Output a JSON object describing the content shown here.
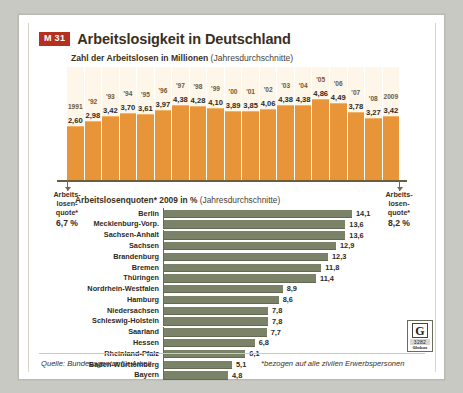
{
  "header": {
    "badge": "M 31",
    "title": "Arbeitslosigkeit in Deutschland",
    "subtitle_bold": "Zahl der Arbeitslosen in Millionen",
    "subtitle_light": "(Jahresdurchschnitte)"
  },
  "quote_left": {
    "line1": "Arbeits-",
    "line2": "losen-",
    "line3": "quote*",
    "value": "6,7 %"
  },
  "quote_right": {
    "line1": "Arbeits-",
    "line2": "losen-",
    "line3": "quote*",
    "value": "8,2 %"
  },
  "bar_header": {
    "bold": "Arbeitslosenquoten* 2009 in %",
    "light": "(Jahresdurchschnitte)"
  },
  "footer": {
    "source": "Quelle: Bundesagentur für Arbeit",
    "note": "*bezogen auf alle zivilen Erwerbspersonen",
    "logo_letter": "G",
    "logo_number": "3282",
    "logo_name": "Globus"
  },
  "colors": {
    "accent_red": "#b5301f",
    "column_orange": "#e8953a",
    "bar_green": "#7a8268",
    "column_bg": "#fdf6e9",
    "card_bg": "#ffffff"
  },
  "chart_data": [
    {
      "type": "bar",
      "title": "Zahl der Arbeitslosen in Millionen (Jahresdurchschnitte)",
      "xlabel": "",
      "ylabel": "Millionen",
      "ylim": [
        0,
        5.2
      ],
      "categories": [
        "1991",
        "'92",
        "'93",
        "'94",
        "'95",
        "'96",
        "'97",
        "'98",
        "'99",
        "'00",
        "'01",
        "'02",
        "'03",
        "'04",
        "'05",
        "'06",
        "'07",
        "'08",
        "2009"
      ],
      "values": [
        2.6,
        2.98,
        3.42,
        3.7,
        3.61,
        3.97,
        4.38,
        4.28,
        4.1,
        3.89,
        3.85,
        4.06,
        4.38,
        4.38,
        4.86,
        4.49,
        3.78,
        3.27,
        3.42
      ],
      "value_labels": [
        "2,60",
        "2,98",
        "3,42",
        "3,70",
        "3,61",
        "3,97",
        "4,38",
        "4,28",
        "4,10",
        "3,89",
        "3,85",
        "4,06",
        "4,38",
        "4,38",
        "4,86",
        "4,49",
        "3,78",
        "3,27",
        "3,42"
      ]
    },
    {
      "type": "bar",
      "title": "Arbeitslosenquoten* 2009 in % (Jahresdurchschnitte)",
      "xlabel": "%",
      "ylabel": "",
      "xlim": [
        0,
        14.1
      ],
      "categories": [
        "Berlin",
        "Mecklenburg-Vorp.",
        "Sachsen-Anhalt",
        "Sachsen",
        "Brandenburg",
        "Bremen",
        "Thüringen",
        "Nordrhein-Westfalen",
        "Hamburg",
        "Niedersachsen",
        "Schleswig-Holstein",
        "Saarland",
        "Hessen",
        "Rheinland-Pfalz",
        "Baden-Württemberg",
        "Bayern"
      ],
      "values": [
        14.1,
        13.6,
        13.6,
        12.9,
        12.3,
        11.8,
        11.4,
        8.9,
        8.6,
        7.8,
        7.8,
        7.7,
        6.8,
        6.1,
        5.1,
        4.8
      ],
      "value_labels": [
        "14,1",
        "13,6",
        "13,6",
        "12,9",
        "12,3",
        "11,8",
        "11,4",
        "8,9",
        "8,6",
        "7,8",
        "7,8",
        "7,7",
        "6,8",
        "6,1",
        "5,1",
        "4,8"
      ]
    }
  ]
}
